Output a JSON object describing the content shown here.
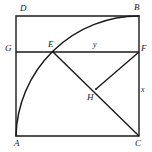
{
  "figure": {
    "type": "geometry-diagram",
    "canvas": {
      "width": 152,
      "height": 152,
      "background": "#ffffff"
    },
    "stroke_color": "#1a1a1a",
    "label_color": "#1a1a1a",
    "square": {
      "name": "ABCD",
      "corners": {
        "A": {
          "x": 16,
          "y": 136
        },
        "B": {
          "x": 139,
          "y": 16
        },
        "C": {
          "x": 139,
          "y": 136
        },
        "D": {
          "x": 16,
          "y": 16
        }
      },
      "side_length": 123
    },
    "arc": {
      "from": "A",
      "to": "B",
      "center": "C",
      "radius": 123,
      "passes_through": "E"
    },
    "points": {
      "E": {
        "x": 53,
        "y": 52
      },
      "F": {
        "x": 139,
        "y": 52
      },
      "G": {
        "x": 16,
        "y": 52
      },
      "H": {
        "x": 96,
        "y": 89
      }
    },
    "segments": [
      {
        "name": "GF",
        "from": "G",
        "to": "F"
      },
      {
        "name": "EC",
        "from": "E",
        "to": "C"
      },
      {
        "name": "HF",
        "from": "H",
        "to": "F"
      }
    ],
    "labels": [
      {
        "id": "label-D",
        "text": "D",
        "x": 20,
        "y": 4,
        "size": "normal"
      },
      {
        "id": "label-B",
        "text": "B",
        "x": 134,
        "y": 3,
        "size": "normal"
      },
      {
        "id": "label-G",
        "text": "G",
        "x": 5,
        "y": 44,
        "size": "normal"
      },
      {
        "id": "label-E",
        "text": "E",
        "x": 48,
        "y": 40,
        "size": "normal"
      },
      {
        "id": "label-y",
        "text": "y",
        "x": 93,
        "y": 41,
        "size": "small"
      },
      {
        "id": "label-F",
        "text": "F",
        "x": 141,
        "y": 44,
        "size": "normal"
      },
      {
        "id": "label-x",
        "text": "x",
        "x": 141,
        "y": 86,
        "size": "small"
      },
      {
        "id": "label-H",
        "text": "H",
        "x": 87,
        "y": 93,
        "size": "normal"
      },
      {
        "id": "label-A",
        "text": "A",
        "x": 14,
        "y": 139,
        "size": "normal"
      },
      {
        "id": "label-C",
        "text": "C",
        "x": 135,
        "y": 139,
        "size": "normal"
      }
    ]
  }
}
